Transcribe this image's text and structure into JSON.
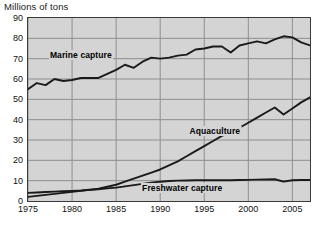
{
  "chart_data": {
    "type": "line",
    "title": "Millions of tons",
    "xlabel": "",
    "ylabel": "Millions of tons",
    "xlim": [
      1975,
      2007
    ],
    "ylim": [
      0,
      90
    ],
    "ytick_values": [
      0,
      10,
      20,
      30,
      40,
      50,
      60,
      70,
      80,
      90
    ],
    "ytick_labels": [
      "0",
      "10",
      "20",
      "30",
      "40",
      "50",
      "60",
      "70",
      "80",
      "90"
    ],
    "xtick_values": [
      1975,
      1980,
      1985,
      1990,
      1995,
      2000,
      2005
    ],
    "xtick_labels": [
      "1975",
      "1980",
      "1985",
      "1990",
      "1995",
      "2000",
      "2005"
    ],
    "grid": true,
    "grid_color": "#8f8f8f",
    "plot_background": "#d4d4d4",
    "line_color": "#1a1a1a",
    "legend": "inline-annotations",
    "x": [
      1975,
      1976,
      1977,
      1978,
      1979,
      1980,
      1981,
      1982,
      1983,
      1984,
      1985,
      1986,
      1987,
      1988,
      1989,
      1990,
      1991,
      1992,
      1993,
      1994,
      1995,
      1996,
      1997,
      1998,
      1999,
      2000,
      2001,
      2002,
      2003,
      2004,
      2005,
      2006,
      2007
    ],
    "series": [
      {
        "name": "Marine capture",
        "values": [
          55.0,
          58.0,
          57.0,
          60.0,
          59.0,
          59.5,
          60.5,
          60.5,
          60.5,
          62.5,
          64.5,
          67.0,
          65.5,
          68.5,
          70.5,
          70.0,
          70.5,
          71.5,
          72.0,
          74.5,
          75.0,
          76.0,
          76.0,
          73.0,
          76.5,
          77.5,
          78.5,
          77.5,
          79.5,
          81.0,
          80.5,
          78.0,
          76.5
        ]
      },
      {
        "name": "Aquaculture",
        "values": [
          2.0,
          2.5,
          3.0,
          3.5,
          4.0,
          4.5,
          5.0,
          5.5,
          6.0,
          7.0,
          8.0,
          9.5,
          11.0,
          12.5,
          14.0,
          15.5,
          17.5,
          19.5,
          22.0,
          24.5,
          27.0,
          29.5,
          32.0,
          34.0,
          36.0,
          38.5,
          41.0,
          43.5,
          46.0,
          42.5,
          45.5,
          48.5,
          51.0
        ]
      },
      {
        "name": "Freshwater capture",
        "values": [
          4.0,
          4.2,
          4.4,
          4.6,
          4.8,
          5.0,
          5.2,
          5.5,
          5.8,
          6.2,
          6.6,
          7.2,
          7.8,
          8.4,
          9.0,
          9.5,
          9.8,
          10.0,
          10.1,
          10.2,
          10.2,
          10.2,
          10.2,
          10.2,
          10.3,
          10.4,
          10.5,
          10.6,
          10.7,
          9.5,
          10.2,
          10.3,
          10.3
        ]
      }
    ],
    "annotations": [
      {
        "text": "Marine capture",
        "x": 1981.0,
        "y": 72.0
      },
      {
        "text": "Aquaculture",
        "x": 1996.2,
        "y": 34.5
      },
      {
        "text": "Freshwater capture",
        "x": 1992.5,
        "y": 6.5
      }
    ]
  }
}
